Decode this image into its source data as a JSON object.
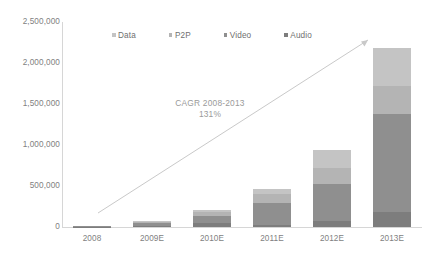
{
  "chart_data": {
    "type": "bar",
    "subtype": "stacked-bar",
    "title": "",
    "xlabel": "",
    "ylabel": "",
    "categories": [
      "2008",
      "2009E",
      "2010E",
      "2011E",
      "2012E",
      "2013E"
    ],
    "series": [
      {
        "name": "Audio",
        "color": "#7d7d7d",
        "values": [
          6000,
          16000,
          45000,
          30000,
          70000,
          185000
        ]
      },
      {
        "name": "Video",
        "color": "#8f8f8f",
        "values": [
          7000,
          30000,
          95000,
          265000,
          455000,
          1190000
        ]
      },
      {
        "name": "P2P",
        "color": "#b4b4b4",
        "values": [
          3000,
          14000,
          40000,
          105000,
          200000,
          345000
        ]
      },
      {
        "name": "Data",
        "color": "#c4c4c4",
        "values": [
          2000,
          10000,
          25000,
          65000,
          215000,
          460000
        ]
      }
    ],
    "totals": [
      18000,
      70000,
      205000,
      465000,
      940000,
      2180000
    ],
    "ylim": [
      0,
      2500000
    ],
    "ytick_step": 500000,
    "ytick_labels": [
      "0",
      "500,000",
      "1,000,000",
      "1,500,000",
      "2,000,000",
      "2,500,000"
    ],
    "ytick_values": [
      0,
      500000,
      1000000,
      1500000,
      2000000,
      2500000
    ],
    "grid": false,
    "legend_position": "top-center",
    "legend_entries": [
      "Data",
      "P2P",
      "Video",
      "Audio"
    ],
    "annotations": [
      {
        "name": "cagr-annotation",
        "line1": "CAGR 2008-2013",
        "line2": "131%",
        "value": 131,
        "unit": "%",
        "period": "2008-2013"
      }
    ],
    "trend_arrow": {
      "name": "cagr-trend-arrow",
      "from_category": "2008",
      "to_category": "2013E",
      "color": "#c9c9c9"
    }
  },
  "axis": {
    "y_labels": [
      "2,500,000",
      "2,000,000",
      "1,500,000",
      "1,000,000",
      "500,000",
      "0"
    ],
    "x_labels": [
      "2008",
      "2009E",
      "2010E",
      "2011E",
      "2012E",
      "2013E"
    ]
  },
  "legend": {
    "items": [
      {
        "label": "Data",
        "color": "#c4c4c4"
      },
      {
        "label": "P2P",
        "color": "#b4b4b4"
      },
      {
        "label": "Video",
        "color": "#8f8f8f"
      },
      {
        "label": "Audio",
        "color": "#7d7d7d"
      }
    ]
  },
  "annotation": {
    "line1": "CAGR 2008-2013",
    "line2": "131%"
  },
  "colors": {
    "axis": "#d6d6d6",
    "tick_text": "#7f7f7f",
    "legend_text": "#6f6f6f",
    "annotation_text": "#9a9a9a",
    "arrow": "#c9c9c9",
    "background": "#ffffff"
  }
}
